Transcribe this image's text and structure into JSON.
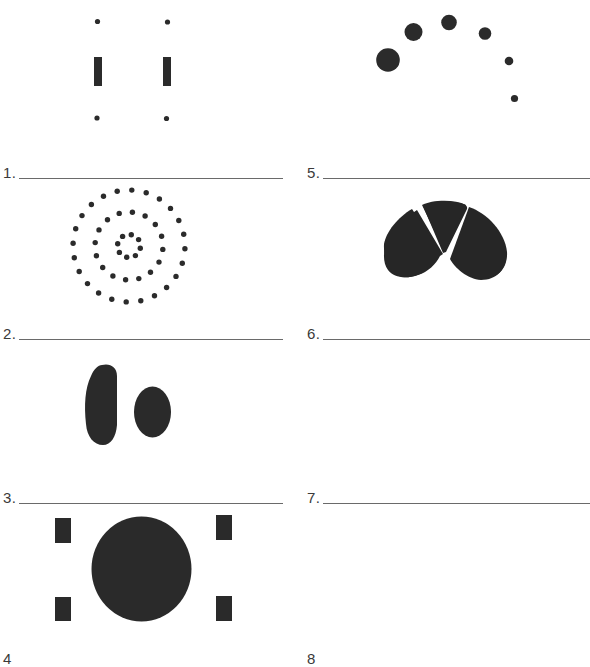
{
  "worksheet": {
    "ink_color": "#2a2a2a",
    "items": [
      {
        "number": "1.",
        "answer": "",
        "figure": "two-bars-with-dots"
      },
      {
        "number": "2.",
        "answer": "",
        "figure": "concentric-dot-circles"
      },
      {
        "number": "3.",
        "answer": "",
        "figure": "two-ovals"
      },
      {
        "number": "4",
        "answer": "",
        "figure": "circle-with-four-rectangles"
      },
      {
        "number": "5.",
        "answer": "",
        "figure": "arc-of-shrinking-dots"
      },
      {
        "number": "6.",
        "answer": "",
        "figure": "three-lobed-shape"
      },
      {
        "number": "7.",
        "answer": "",
        "figure": "blank"
      },
      {
        "number": "8",
        "answer": "",
        "figure": "blank"
      }
    ]
  }
}
